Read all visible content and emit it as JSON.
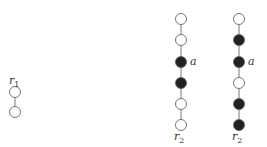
{
  "colors": {
    "node_stroke": "#555555",
    "filled": "#222222",
    "empty": "#ffffff",
    "edge": "#555555"
  },
  "node_radius": 5.5,
  "paths": [
    {
      "name": "path-r1",
      "x": 15,
      "nodes": [
        {
          "y": 92,
          "filled": false
        },
        {
          "y": 112,
          "filled": false
        }
      ],
      "labels": [
        {
          "text": "r",
          "sub": "1",
          "x": 9,
          "y": 84
        }
      ]
    },
    {
      "name": "path-middle",
      "x": 181,
      "nodes": [
        {
          "y": 19,
          "filled": false
        },
        {
          "y": 40,
          "filled": false
        },
        {
          "y": 62,
          "filled": true
        },
        {
          "y": 83,
          "filled": true
        },
        {
          "y": 104,
          "filled": false
        },
        {
          "y": 125,
          "filled": false
        }
      ],
      "labels": [
        {
          "text": "a",
          "sub": "",
          "x": 190,
          "y": 65
        },
        {
          "text": "r",
          "sub": "2",
          "x": 174,
          "y": 140
        }
      ]
    },
    {
      "name": "path-right",
      "x": 239,
      "nodes": [
        {
          "y": 19,
          "filled": false
        },
        {
          "y": 40,
          "filled": true
        },
        {
          "y": 62,
          "filled": true
        },
        {
          "y": 83,
          "filled": false
        },
        {
          "y": 104,
          "filled": true
        },
        {
          "y": 125,
          "filled": true
        }
      ],
      "labels": [
        {
          "text": "a",
          "sub": "",
          "x": 248,
          "y": 65
        },
        {
          "text": "r",
          "sub": "2",
          "x": 232,
          "y": 140
        }
      ]
    }
  ]
}
